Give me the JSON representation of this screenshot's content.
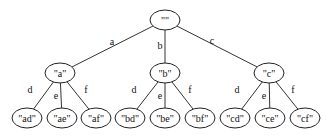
{
  "diagram": {
    "type": "tree",
    "background": "#ffffff",
    "node_color": "#222222",
    "nodes": [
      {
        "id": "root",
        "label": "\"\"",
        "cx": 165,
        "cy": 20,
        "rx": 15,
        "ry": 10
      },
      {
        "id": "a",
        "label": "\"a\"",
        "cx": 60,
        "cy": 73,
        "rx": 15,
        "ry": 10
      },
      {
        "id": "b",
        "label": "\"b\"",
        "cx": 165,
        "cy": 73,
        "rx": 15,
        "ry": 10
      },
      {
        "id": "c",
        "label": "\"c\"",
        "cx": 269,
        "cy": 73,
        "rx": 15,
        "ry": 10
      },
      {
        "id": "ad",
        "label": "\"ad\"",
        "cx": 27,
        "cy": 118,
        "rx": 15,
        "ry": 10
      },
      {
        "id": "ae",
        "label": "\"ae\"",
        "cx": 62,
        "cy": 118,
        "rx": 15,
        "ry": 10
      },
      {
        "id": "af",
        "label": "\"af\"",
        "cx": 96,
        "cy": 118,
        "rx": 15,
        "ry": 10
      },
      {
        "id": "bd",
        "label": "\"bd\"",
        "cx": 130,
        "cy": 118,
        "rx": 15,
        "ry": 10
      },
      {
        "id": "be",
        "label": "\"be\"",
        "cx": 165,
        "cy": 118,
        "rx": 15,
        "ry": 10
      },
      {
        "id": "bf",
        "label": "\"bf\"",
        "cx": 200,
        "cy": 118,
        "rx": 15,
        "ry": 10
      },
      {
        "id": "cd",
        "label": "\"cd\"",
        "cx": 235,
        "cy": 118,
        "rx": 15,
        "ry": 10
      },
      {
        "id": "ce",
        "label": "\"ce\"",
        "cx": 270,
        "cy": 118,
        "rx": 15,
        "ry": 10
      },
      {
        "id": "cf",
        "label": "\"cf\"",
        "cx": 305,
        "cy": 118,
        "rx": 15,
        "ry": 10
      }
    ],
    "edges": [
      {
        "from": "root",
        "to": "a",
        "label": "a",
        "lx": 112,
        "ly": 41
      },
      {
        "from": "root",
        "to": "b",
        "label": "b",
        "lx": 160,
        "ly": 45
      },
      {
        "from": "root",
        "to": "c",
        "label": "c",
        "lx": 212,
        "ly": 40
      },
      {
        "from": "a",
        "to": "ad",
        "label": "d",
        "lx": 30,
        "ly": 89
      },
      {
        "from": "a",
        "to": "ae",
        "label": "e",
        "lx": 56,
        "ly": 95
      },
      {
        "from": "a",
        "to": "af",
        "label": "f",
        "lx": 86,
        "ly": 89
      },
      {
        "from": "b",
        "to": "bd",
        "label": "d",
        "lx": 134,
        "ly": 89
      },
      {
        "from": "b",
        "to": "be",
        "label": "e",
        "lx": 160,
        "ly": 95
      },
      {
        "from": "b",
        "to": "bf",
        "label": "f",
        "lx": 190,
        "ly": 89
      },
      {
        "from": "c",
        "to": "cd",
        "label": "d",
        "lx": 237,
        "ly": 89
      },
      {
        "from": "c",
        "to": "ce",
        "label": "e",
        "lx": 264,
        "ly": 95
      },
      {
        "from": "c",
        "to": "cf",
        "label": "f",
        "lx": 293,
        "ly": 89
      }
    ]
  }
}
